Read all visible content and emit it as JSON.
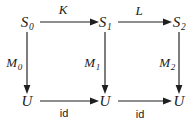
{
  "diagram": {
    "kind": "commutative-diagram",
    "nodes": [
      {
        "id": "s0",
        "base": "S",
        "subscript": "0",
        "x": 27,
        "y": 22,
        "row": "top",
        "col": 0
      },
      {
        "id": "s1",
        "base": "S",
        "subscript": "1",
        "x": 105,
        "y": 22,
        "row": "top",
        "col": 1
      },
      {
        "id": "s2",
        "base": "S",
        "subscript": "2",
        "x": 179,
        "y": 22,
        "row": "top",
        "col": 2
      },
      {
        "id": "u0",
        "base": "U",
        "subscript": "",
        "x": 27,
        "y": 101,
        "row": "bottom",
        "col": 0
      },
      {
        "id": "u1",
        "base": "U",
        "subscript": "",
        "x": 105,
        "y": 101,
        "row": "bottom",
        "col": 1
      },
      {
        "id": "u2",
        "base": "U",
        "subscript": "",
        "x": 179,
        "y": 101,
        "row": "bottom",
        "col": 2
      }
    ],
    "edges": [
      {
        "id": "k",
        "from": "s0",
        "to": "s1",
        "base": "K",
        "subscript": "",
        "style": "italic",
        "label_x": 63,
        "label_y": 9,
        "orientation": "horizontal"
      },
      {
        "id": "l",
        "from": "s1",
        "to": "s2",
        "base": "L",
        "subscript": "",
        "style": "italic",
        "label_x": 139,
        "label_y": 10,
        "orientation": "horizontal"
      },
      {
        "id": "m0",
        "from": "s0",
        "to": "u0",
        "base": "M",
        "subscript": "0",
        "style": "italic",
        "label_x": 14,
        "label_y": 62,
        "orientation": "vertical"
      },
      {
        "id": "m1",
        "from": "s1",
        "to": "u1",
        "base": "M",
        "subscript": "1",
        "style": "italic",
        "label_x": 92,
        "label_y": 62,
        "orientation": "vertical"
      },
      {
        "id": "m2",
        "from": "s2",
        "to": "u2",
        "base": "M",
        "subscript": "2",
        "style": "italic",
        "label_x": 167,
        "label_y": 62,
        "orientation": "vertical"
      },
      {
        "id": "id1",
        "from": "u0",
        "to": "u1",
        "base": "id",
        "subscript": "",
        "style": "roman",
        "label_x": 64,
        "label_y": 113,
        "orientation": "horizontal"
      },
      {
        "id": "id2",
        "from": "u1",
        "to": "u2",
        "base": "id",
        "subscript": "",
        "style": "roman",
        "label_x": 140,
        "label_y": 114,
        "orientation": "horizontal"
      }
    ],
    "strokes": {
      "ink": "#1f1f1f",
      "background": "#ffffff"
    }
  }
}
